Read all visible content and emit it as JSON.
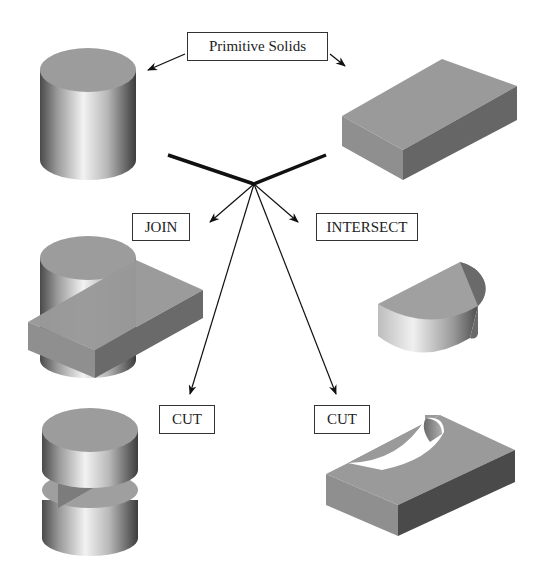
{
  "diagram": {
    "title_label": "Primitive Solids",
    "operations": [
      {
        "label": "JOIN"
      },
      {
        "label": "INTERSECT"
      },
      {
        "label": "CUT"
      },
      {
        "label": "CUT"
      }
    ],
    "shapes": [
      {
        "name": "cylinder",
        "role": "primitive"
      },
      {
        "name": "box",
        "role": "primitive"
      },
      {
        "name": "join-result",
        "role": "result"
      },
      {
        "name": "intersect-result",
        "role": "result"
      },
      {
        "name": "cut-cylinder-result",
        "role": "result"
      },
      {
        "name": "cut-box-result",
        "role": "result"
      }
    ],
    "colors": {
      "face_top": "#9a9a9a",
      "face_side_light": "#8e8e8e",
      "face_side_dark": "#5a5a5a",
      "line": "#111111"
    }
  }
}
